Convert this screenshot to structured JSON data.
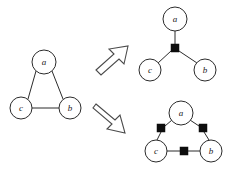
{
  "figure": {
    "background_color": "#ffffff",
    "stroke_color": "#2b2b2b",
    "node_fill": "#ffffff",
    "square_color": "#0d0d0d",
    "arrow_stroke": "#4a4a4a",
    "width": 230,
    "height": 174
  },
  "panels": [
    {
      "id": "source-graph",
      "name": "triangle-graph",
      "role": "source",
      "nodes": [
        {
          "id": "a",
          "label": "a",
          "cx": 44,
          "cy": 62,
          "r": 12
        },
        {
          "id": "c",
          "label": "c",
          "cx": 21,
          "cy": 108,
          "r": 11
        },
        {
          "id": "b",
          "label": "b",
          "cx": 70,
          "cy": 108,
          "r": 11
        }
      ],
      "edges": [
        {
          "id": "a-c",
          "from": "a",
          "to": "c"
        },
        {
          "id": "a-b",
          "from": "a",
          "to": "b"
        },
        {
          "id": "c-b",
          "from": "c",
          "to": "b"
        }
      ],
      "squares": []
    },
    {
      "id": "single-hyperedge-graph",
      "name": "star-hyperedge-graph",
      "role": "result-top",
      "nodes": [
        {
          "id": "a",
          "label": "a",
          "cx": 175,
          "cy": 19,
          "r": 12
        },
        {
          "id": "c",
          "label": "c",
          "cx": 150,
          "cy": 70,
          "r": 11
        },
        {
          "id": "b",
          "label": "b",
          "cx": 205,
          "cy": 70,
          "r": 11
        }
      ],
      "squares": [
        {
          "id": "h1",
          "cx": 175,
          "cy": 48,
          "size": 8
        }
      ],
      "edges": [
        {
          "id": "a-h1",
          "from": "a",
          "to": "h1"
        },
        {
          "id": "h1-c",
          "from": "h1",
          "to": "c"
        },
        {
          "id": "h1-b",
          "from": "h1",
          "to": "b"
        }
      ]
    },
    {
      "id": "three-hyperedge-graph",
      "name": "triangle-hyperedge-graph",
      "role": "result-bottom",
      "nodes": [
        {
          "id": "a",
          "label": "a",
          "cx": 181,
          "cy": 113,
          "r": 12
        },
        {
          "id": "c",
          "label": "c",
          "cx": 156,
          "cy": 151,
          "r": 11
        },
        {
          "id": "b",
          "label": "b",
          "cx": 211,
          "cy": 151,
          "r": 11
        }
      ],
      "squares": [
        {
          "id": "h_ac",
          "cx": 161,
          "cy": 128,
          "size": 8
        },
        {
          "id": "h_ab",
          "cx": 203,
          "cy": 128,
          "size": 8
        },
        {
          "id": "h_cb",
          "cx": 184,
          "cy": 151,
          "size": 8
        }
      ],
      "edges": [
        {
          "id": "a-hac",
          "from": "a",
          "to": "h_ac"
        },
        {
          "id": "hac-c",
          "from": "h_ac",
          "to": "c"
        },
        {
          "id": "a-hab",
          "from": "a",
          "to": "h_ab"
        },
        {
          "id": "hab-b",
          "from": "h_ab",
          "to": "b"
        },
        {
          "id": "c-hcb",
          "from": "c",
          "to": "h_cb"
        },
        {
          "id": "hcb-b",
          "from": "h_cb",
          "to": "b"
        }
      ]
    }
  ],
  "arrows": [
    {
      "id": "arrow-top",
      "name": "transform-arrow-up-right",
      "direction": "up-right",
      "points": "96,68 115,52 110,48 127,47 122,62 117,58 99,73"
    },
    {
      "id": "arrow-bottom",
      "name": "transform-arrow-down-right",
      "direction": "down-right",
      "points": "98,104 117,120 121,115 126,131 109,127 114,122 95,107"
    }
  ]
}
